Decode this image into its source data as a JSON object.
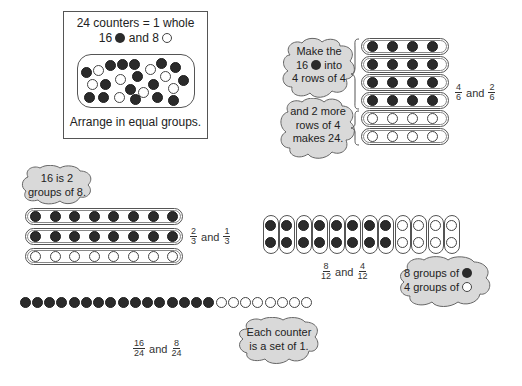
{
  "intro_box": {
    "title": "24 counters = 1 whole",
    "subtitle_prefix": "16",
    "subtitle_mid": "and 8",
    "instruction": "Arrange in equal groups.",
    "filled_count": 16,
    "empty_count": 8
  },
  "rows_of_4": {
    "cloud_top": [
      "Make the",
      "16",
      "into",
      "4 rows of 4"
    ],
    "cloud_bottom": [
      "and 2 more",
      "rows of 4",
      "makes 24."
    ],
    "filled_rows": 4,
    "empty_rows": 2,
    "per_row": 4,
    "fraction_a": {
      "num": "4",
      "den": "6"
    },
    "and_label": "and",
    "fraction_b": {
      "num": "2",
      "den": "6"
    }
  },
  "rows_of_8": {
    "cloud": [
      "16 is 2",
      "groups of 8."
    ],
    "filled_rows": 2,
    "empty_rows": 1,
    "per_row": 8,
    "fraction_a": {
      "num": "2",
      "den": "3"
    },
    "and_label": "and",
    "fraction_b": {
      "num": "1",
      "den": "3"
    }
  },
  "pairs": {
    "filled_groups": 8,
    "empty_groups": 4,
    "per_group": 2,
    "fraction_a": {
      "num": "8",
      "den": "12"
    },
    "and_label": "and",
    "fraction_b": {
      "num": "4",
      "den": "12"
    },
    "cloud_line1": "8 groups of",
    "cloud_line2": "4 groups of"
  },
  "singles": {
    "filled": 16,
    "empty": 8,
    "fraction_a": {
      "num": "16",
      "den": "24"
    },
    "and_label": "and",
    "fraction_b": {
      "num": "8",
      "den": "24"
    },
    "cloud": [
      "Each counter",
      "is a set of 1."
    ]
  },
  "colors": {
    "filled_counter": "#2b2b2b",
    "empty_counter": "#ffffff",
    "cloud_fill": "#d9d9d9",
    "outline": "#555555"
  }
}
